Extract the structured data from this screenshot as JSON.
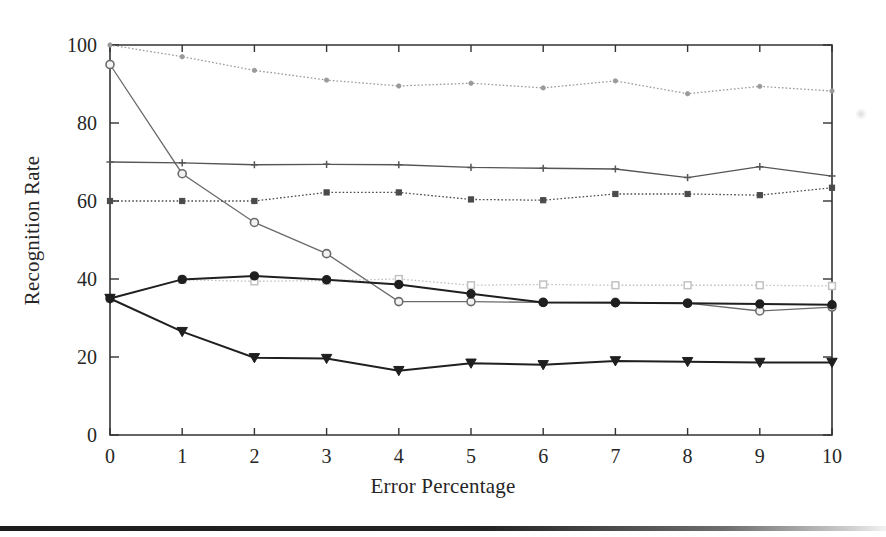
{
  "figure": {
    "caption_bar": "page-edge-artifact"
  },
  "chart_data": {
    "type": "line",
    "title": "",
    "xlabel": "Error Percentage",
    "ylabel": "Recognition Rate",
    "x": [
      0,
      1,
      2,
      3,
      4,
      5,
      6,
      7,
      8,
      9,
      10
    ],
    "xlim": [
      0,
      10
    ],
    "ylim": [
      0,
      100
    ],
    "xticks": [
      "0",
      "1",
      "2",
      "3",
      "4",
      "5",
      "6",
      "7",
      "8",
      "9",
      "10"
    ],
    "yticks": [
      "0",
      "20",
      "40",
      "60",
      "80",
      "100"
    ],
    "grid": false,
    "legend": "none",
    "series": [
      {
        "name": "series-1-light-dot",
        "color": "#9a9a9a",
        "marker": "dot",
        "linestyle": "dotted",
        "values": [
          100,
          97,
          93.5,
          91,
          89.5,
          90.2,
          89,
          90.8,
          87.5,
          89.4,
          88.2
        ]
      },
      {
        "name": "series-2-steep-circle",
        "color": "#6b6b6b",
        "marker": "circle",
        "linestyle": "solid",
        "values": [
          95,
          67,
          54.5,
          46.5,
          34.2,
          34.2,
          34,
          34,
          33.8,
          31.8,
          32.8
        ]
      },
      {
        "name": "series-3-plus",
        "color": "#555555",
        "marker": "plus",
        "linestyle": "solid",
        "values": [
          70,
          69.8,
          69.3,
          69.4,
          69.3,
          68.6,
          68.4,
          68.2,
          66,
          68.8,
          66.4
        ]
      },
      {
        "name": "series-4-small-square",
        "color": "#4a4a4a",
        "marker": "small-square",
        "linestyle": "dotted",
        "values": [
          60,
          60,
          60,
          62.2,
          62.2,
          60.4,
          60.2,
          61.8,
          61.8,
          61.5,
          63.4
        ]
      },
      {
        "name": "series-5-open-square",
        "color": "#c2c2c2",
        "marker": "open-square",
        "linestyle": "dotted",
        "values": [
          35,
          39.8,
          39.4,
          39.6,
          40,
          38.4,
          38.6,
          38.4,
          38.4,
          38.4,
          38.2
        ]
      },
      {
        "name": "series-6-triangle-down",
        "color": "#1f1f1f",
        "marker": "triangle-down",
        "linestyle": "solid",
        "values": [
          35,
          26.5,
          19.8,
          19.6,
          16.5,
          18.4,
          18,
          19,
          18.8,
          18.6,
          18.6
        ]
      },
      {
        "name": "series-7-dark-circle",
        "color": "#1f1f1f",
        "marker": "circle-filled",
        "linestyle": "solid",
        "values": [
          35,
          39.9,
          40.8,
          39.8,
          38.6,
          36.2,
          34,
          33.9,
          33.8,
          33.6,
          33.4
        ]
      }
    ]
  }
}
